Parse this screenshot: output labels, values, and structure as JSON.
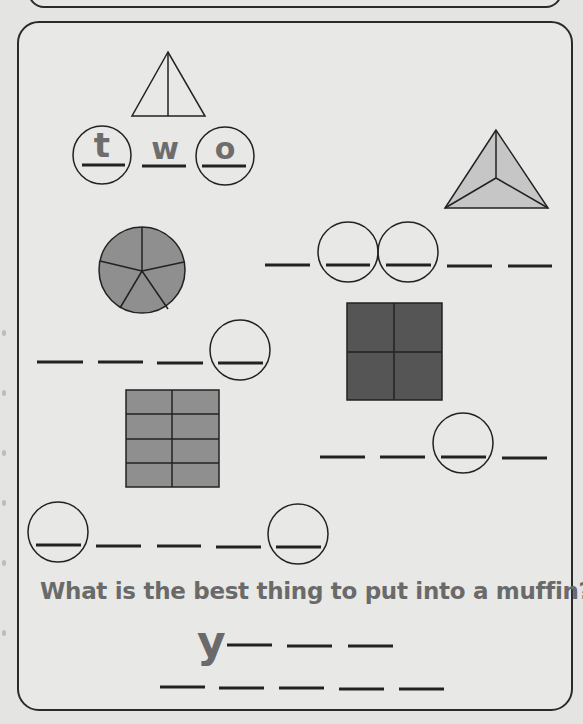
{
  "worksheet": {
    "example": {
      "letters": [
        "t",
        "w",
        "o"
      ],
      "shape": "triangle-halves"
    },
    "puzzles": [
      {
        "shape": "pyramid-thirds",
        "blanks": 6,
        "circled": [
          2,
          3
        ]
      },
      {
        "shape": "circle-fifths",
        "blanks": 4,
        "circled": [
          4
        ]
      },
      {
        "shape": "square-fourths",
        "blanks": 4,
        "circled": [
          3
        ]
      },
      {
        "shape": "rectangle-eighths",
        "blanks": 6,
        "circled": [
          1,
          6
        ]
      }
    ],
    "question": "What is the best thing to put into a muffin?",
    "answer": {
      "first_letter": "y",
      "line1_blanks": 3,
      "line2_blanks": 5
    },
    "colors": {
      "shape_light": "#c4c4c4",
      "shape_mid": "#8e8e8e",
      "shape_dark": "#555555",
      "text_gray": "#6a6a6a",
      "line": "#222222"
    }
  }
}
